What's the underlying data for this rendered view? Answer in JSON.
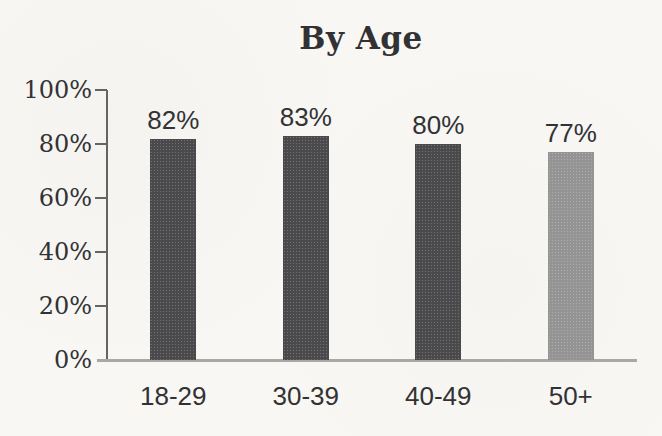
{
  "page": {
    "background": "#f8f7f4"
  },
  "chart_data": {
    "type": "bar",
    "title": "By Age",
    "categories": [
      "18-29",
      "30-39",
      "40-49",
      "50+"
    ],
    "values": [
      82,
      83,
      80,
      77
    ],
    "value_labels": [
      "82%",
      "83%",
      "80%",
      "77%"
    ],
    "xlabel": "",
    "ylabel": "",
    "ylim": [
      0,
      100
    ],
    "yticks": [
      {
        "label": "0%",
        "value": 0
      },
      {
        "label": "20%",
        "value": 20
      },
      {
        "label": "40%",
        "value": 40
      },
      {
        "label": "60%",
        "value": 60
      },
      {
        "label": "80%",
        "value": 80
      },
      {
        "label": "100%",
        "value": 100
      }
    ],
    "grid": false,
    "legend": false,
    "bar_colors": [
      "#4a4a4c",
      "#4a4a4c",
      "#4a4a4c",
      "#949494"
    ],
    "text_color": "#323234",
    "axis_color": "#646466",
    "baseline_color": "#aaa8a4"
  }
}
